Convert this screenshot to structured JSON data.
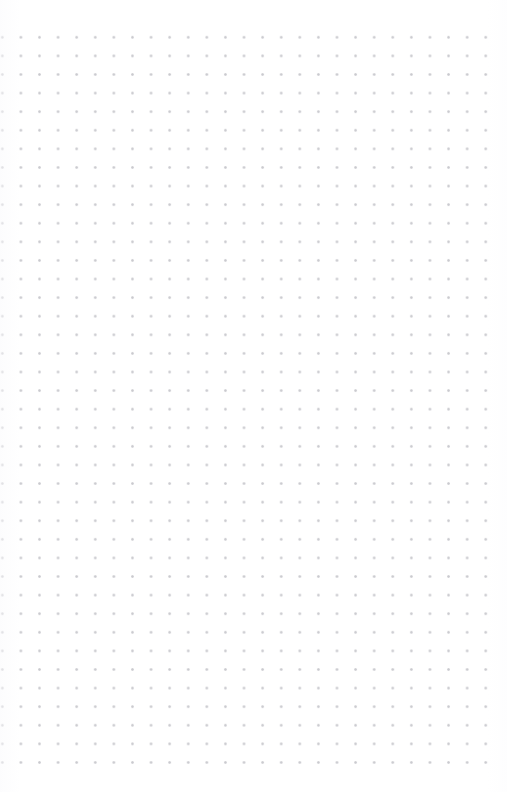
{
  "page": {
    "kind": "dot-grid-notebook-page",
    "width": 507,
    "height": 792,
    "background_color": "#ffffff",
    "title": "",
    "content_text": "",
    "has_written_content": false
  },
  "grid": {
    "label": "dot-grid",
    "dot_color": "#c9c9ce",
    "dot_diameter_px": 1.7,
    "spacing_x_px": 18.6,
    "spacing_y_px": 18.6,
    "origin_x_px": 2,
    "origin_y_px": 37,
    "columns": 27,
    "rows": 40,
    "last_dot_x_px": 478,
    "last_dot_y_px": 757,
    "margin_top_px": 37,
    "margin_right_px": 29,
    "margin_bottom_px": 35,
    "margin_left_px": 2,
    "left_column_clipped": true
  }
}
